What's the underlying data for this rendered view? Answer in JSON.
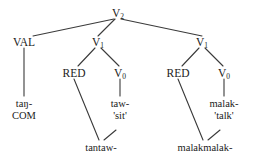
{
  "diagram": {
    "type": "syntactic-tree",
    "title": "",
    "line_color": "#3a3a3a",
    "text_color": "#1b1b1b",
    "background": "#ffffff",
    "nodes": {
      "root": {
        "label": "V",
        "subscript": "2"
      },
      "val": {
        "label": "VAL"
      },
      "v1_left": {
        "label": "V",
        "subscript": "1"
      },
      "v1_right": {
        "label": "V",
        "subscript": "1"
      },
      "red_left": {
        "label": "RED"
      },
      "v0_left": {
        "label": "V",
        "subscript": "0"
      },
      "red_right": {
        "label": "RED"
      },
      "v0_right": {
        "label": "V",
        "subscript": "0"
      }
    },
    "leaves": {
      "val_leaf_line1": "taŋ-",
      "val_leaf_line2": "COM",
      "v0_left_line1": "taw-",
      "v0_left_line2": "'sit'",
      "v1_left_output": "tantaw-",
      "v0_right_line1": "malak-",
      "v0_right_line2": "'talk'",
      "v1_right_output": "malakmalak-"
    }
  }
}
